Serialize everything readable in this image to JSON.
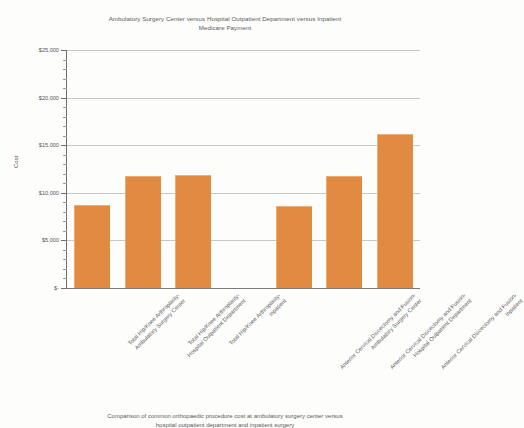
{
  "chart_data": {
    "type": "bar",
    "title": "Ambulatory Surgery Center versus Hospital Outpatient Department versus Inpatient Medicare Payment",
    "title_lines": [
      "Ambulatory Surgery Center versus Hospital Outpatient Department versus Inpatient",
      "Medicare Payment"
    ],
    "caption_lines": [
      "Comparison of common orthopaedic procedure cost at ambulatory surgery center versus",
      "hospital outpatient department and inpatient surgery"
    ],
    "xlabel": "",
    "ylabel": "Cost",
    "ylim": [
      0,
      25000
    ],
    "grid": true,
    "legend": "none",
    "bar_color": "#E08A42",
    "categories": [
      "Total Hip/Knee Arthroplasty- Ambulatory Surgery Center",
      "Total Hip/Knee Arthroplasty- Hospital Outpatient Department",
      "Total Hip/Knee Arthroplasty- Inpatient",
      "Anterior Cervical Discectomy and Fusion- Ambulatory Surgery Center",
      "Anterior Cervical Discectomy and Fusion- Hospital Outpatient Department",
      "Anterior Cervical Discectomy and Fusion- Inpatient"
    ],
    "category_lines": [
      [
        "Total Hip/Knee Arthroplasty-",
        "Ambulatory Surgery Center"
      ],
      [
        "Total Hip/Knee Arthroplasty-",
        "Hospital Outpatient Department"
      ],
      [
        "Total Hip/Knee Arthroplasty-",
        "Inpatient"
      ],
      [
        "Anterior Cervical Discectomy and Fusion-",
        "Ambulatory Surgery Center"
      ],
      [
        "Anterior Cervical Discectomy and Fusion-",
        "Hospital Outpatient Department"
      ],
      [
        "Anterior Cervical Discectomy and Fusion-",
        "Inpatient"
      ]
    ],
    "values": [
      8700,
      11800,
      11850,
      8600,
      11800,
      16200
    ],
    "ytick_labels": [
      "$-",
      "$5,000",
      "$10,000",
      "$15,000",
      "$20,000",
      "$25,000"
    ],
    "ytick_values": [
      0,
      5000,
      10000,
      15000,
      20000,
      25000
    ]
  }
}
